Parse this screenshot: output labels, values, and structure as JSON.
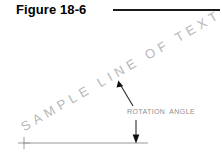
{
  "figure": {
    "title": "Figure 18-6",
    "rule_color": "#1a1a1a"
  },
  "drawing": {
    "sample_text": "SAMPLE LINE OF TEXT",
    "sample_text_color": "#b8b8b8",
    "sample_text_rotation_deg": -30,
    "rotation_angle_label": "ROTATION ANGLE",
    "rotation_angle_label_color": "#8f8f8f",
    "line_color": "#9a9a9a",
    "arrow_color": "#1a1a1a",
    "baseline": {
      "x1": 23,
      "y1": 143,
      "x2": 148,
      "y2": 143
    },
    "origin_marker": {
      "x": 24,
      "y": 143,
      "symbol": "plus"
    },
    "leader_arrow": {
      "from_x": 133,
      "from_y": 104,
      "to_x": 119,
      "to_y": 82
    },
    "vertical_arrow": {
      "from_x": 136,
      "from_y": 122,
      "to_x": 136,
      "to_y": 143
    }
  }
}
